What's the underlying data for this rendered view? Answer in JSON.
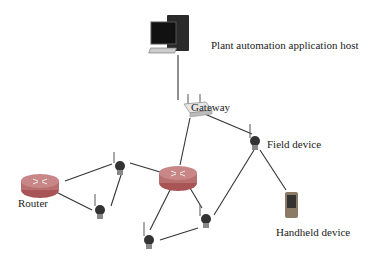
{
  "diagram": {
    "labels": {
      "host": "Plant automation application host",
      "gateway": "Gateway",
      "field_device": "Field device",
      "router": "Router",
      "handheld": "Handheld device"
    },
    "colors": {
      "line": "#333333",
      "router": "#b86f6f",
      "device": "#3a3a3a"
    }
  }
}
